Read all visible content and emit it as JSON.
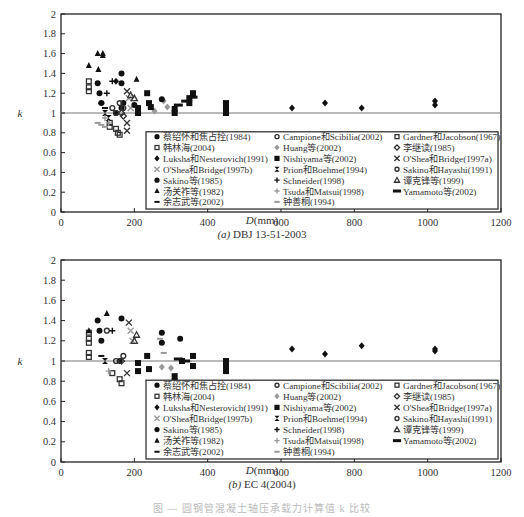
{
  "chart_data": [
    {
      "type": "scatter",
      "panel_label": "(a)",
      "title": "DBJ 13-51-2003",
      "xlabel": "D(mm)",
      "ylabel": "k",
      "xlim": [
        0,
        1200
      ],
      "ylim": [
        0,
        2
      ],
      "xticks": [
        0,
        200,
        400,
        600,
        800,
        1000,
        1200
      ],
      "yticks": [
        0,
        0.2,
        0.4,
        0.6,
        0.8,
        1,
        1.2,
        1.4,
        1.6,
        1.8,
        2
      ],
      "reference_line": 1,
      "legend_position": "inside lower right",
      "series": [
        {
          "name": "蔡绍怀和焦占拴(1984)",
          "marker": "circle",
          "color": "#111111",
          "points": [
            [
              100,
              1.3
            ],
            [
              105,
              1.2
            ],
            [
              110,
              1.1
            ],
            [
              150,
              1.0
            ],
            [
              165,
              1.05
            ],
            [
              170,
              1.1
            ]
          ]
        },
        {
          "name": "Campione和Scibilia(2002)",
          "marker": "circle-open",
          "color": "#333333",
          "points": [
            [
              160,
              1.1
            ],
            [
              170,
              1.05
            ]
          ]
        },
        {
          "name": "Gardner和Jacobson(1967)",
          "marker": "square-open",
          "color": "#333333",
          "points": [
            [
              76,
              1.32
            ],
            [
              76,
              1.26
            ],
            [
              76,
              1.22
            ]
          ]
        },
        {
          "name": "韩林海(2004)",
          "marker": "square-open",
          "color": "#333333",
          "points": [
            [
              133,
              0.9
            ],
            [
              133,
              0.86
            ],
            [
              150,
              0.84
            ],
            [
              155,
              0.8
            ],
            [
              160,
              0.78
            ]
          ]
        },
        {
          "name": "Huang等(2002)",
          "marker": "diamond",
          "color": "#999999",
          "points": [
            [
              280,
              1.12
            ],
            [
              290,
              1.06
            ],
            [
              255,
              1.02
            ]
          ]
        },
        {
          "name": "李继读(1985)",
          "marker": "diamond-open",
          "color": "#333333",
          "points": [
            [
              165,
              1.0
            ],
            [
              170,
              0.97
            ]
          ]
        },
        {
          "name": "Luksha和Nesterovich(1991)",
          "marker": "diamond",
          "color": "#111111",
          "points": [
            [
              630,
              1.05
            ],
            [
              720,
              1.1
            ],
            [
              820,
              1.05
            ],
            [
              1020,
              1.08
            ],
            [
              1020,
              1.12
            ],
            [
              150,
              1.32
            ]
          ]
        },
        {
          "name": "Nishiyama等(2002)",
          "marker": "square",
          "color": "#111111",
          "points": [
            [
              235,
              1.2
            ],
            [
              240,
              1.1
            ],
            [
              245,
              1.06
            ],
            [
              310,
              1.0
            ],
            [
              310,
              1.04
            ],
            [
              350,
              1.1
            ],
            [
              350,
              1.15
            ],
            [
              360,
              1.2
            ],
            [
              450,
              1.0
            ],
            [
              450,
              1.05
            ],
            [
              450,
              1.1
            ],
            [
              210,
              1.0
            ],
            [
              210,
              1.05
            ]
          ]
        },
        {
          "name": "O'Shea和Bridge(1997a)",
          "marker": "x",
          "color": "#333333",
          "points": [
            [
              180,
              1.22
            ],
            [
              180,
              0.9
            ],
            [
              180,
              0.82
            ]
          ]
        },
        {
          "name": "O'Shea和Bridge(1997b)",
          "marker": "x",
          "color": "#999999",
          "points": [
            [
              185,
              1.15
            ],
            [
              190,
              1.05
            ]
          ]
        },
        {
          "name": "Prion和Boehme(1994)",
          "marker": "hourglass",
          "color": "#111111",
          "points": [
            [
              120,
              1.0
            ],
            [
              130,
              0.95
            ]
          ]
        },
        {
          "name": "Sakino和Hayashi(1991)",
          "marker": "circle-open",
          "color": "#333333",
          "points": [
            [
              140,
              1.05
            ],
            [
              150,
              1.0
            ]
          ]
        },
        {
          "name": "Sakino等(1985)",
          "marker": "circle",
          "color": "#111111",
          "points": [
            [
              165,
              1.4
            ],
            [
              165,
              1.3
            ],
            [
              200,
              1.08
            ],
            [
              275,
              1.14
            ]
          ]
        },
        {
          "name": "Schneider(1998)",
          "marker": "plus",
          "color": "#111111",
          "points": [
            [
              140,
              1.32
            ],
            [
              125,
              1.2
            ]
          ]
        },
        {
          "name": "谭克锋等(1999)",
          "marker": "triangle-open",
          "color": "#333333",
          "points": [
            [
              190,
              1.18
            ],
            [
              200,
              1.15
            ]
          ]
        },
        {
          "name": "汤关祚等(1982)",
          "marker": "triangle",
          "color": "#111111",
          "points": [
            [
              76,
              1.48
            ],
            [
              100,
              1.6
            ],
            [
              114,
              1.58
            ],
            [
              114,
              1.6
            ],
            [
              102,
              1.44
            ],
            [
              206,
              1.34
            ]
          ]
        },
        {
          "name": "Tsuda和Matsui(1998)",
          "marker": "plus",
          "color": "#999999",
          "points": [
            [
              120,
              0.95
            ],
            [
              130,
              0.9
            ]
          ]
        },
        {
          "name": "Yamamoto等(2002)",
          "marker": "dash-bold",
          "color": "#111111",
          "points": [
            [
              320,
              1.08
            ],
            [
              340,
              1.12
            ],
            [
              360,
              1.16
            ]
          ]
        },
        {
          "name": "余志武等(2002)",
          "marker": "dash",
          "color": "#111111",
          "points": [
            [
              110,
              1.1
            ],
            [
              120,
              1.05
            ]
          ]
        },
        {
          "name": "钟善桐(1994)",
          "marker": "dash",
          "color": "#999999",
          "points": [
            [
              100,
              0.9
            ],
            [
              110,
              0.88
            ],
            [
              120,
              0.86
            ]
          ]
        }
      ]
    },
    {
      "type": "scatter",
      "panel_label": "(b)",
      "title": "EC 4(2004)",
      "xlabel": "D(mm)",
      "ylabel": "k",
      "xlim": [
        0,
        1200
      ],
      "ylim": [
        0,
        2
      ],
      "xticks": [
        0,
        200,
        400,
        600,
        800,
        1000,
        1200
      ],
      "yticks": [
        0,
        0.2,
        0.4,
        0.6,
        0.8,
        1,
        1.2,
        1.4,
        1.6,
        1.8,
        2
      ],
      "reference_line": 1,
      "legend_position": "inside lower right",
      "series": [
        {
          "name": "蔡绍怀和焦占拴(1984)",
          "marker": "circle",
          "color": "#111111",
          "points": [
            [
              100,
              1.4
            ],
            [
              105,
              1.3
            ],
            [
              110,
              1.2
            ],
            [
              160,
              1.0
            ]
          ]
        },
        {
          "name": "Campione和Scibilia(2002)",
          "marker": "circle-open",
          "color": "#333333",
          "points": [
            [
              125,
              1.3
            ],
            [
              170,
              1.05
            ]
          ]
        },
        {
          "name": "Gardner和Jacobson(1967)",
          "marker": "square-open",
          "color": "#333333",
          "points": [
            [
              76,
              1.28
            ],
            [
              76,
              1.22
            ],
            [
              76,
              1.18
            ],
            [
              76,
              1.08
            ],
            [
              76,
              1.04
            ]
          ]
        },
        {
          "name": "韩林海(2004)",
          "marker": "square-open",
          "color": "#333333",
          "points": [
            [
              140,
              0.88
            ],
            [
              160,
              0.82
            ],
            [
              165,
              0.78
            ]
          ]
        },
        {
          "name": "Huang等(2002)",
          "marker": "diamond",
          "color": "#999999",
          "points": [
            [
              275,
              0.94
            ],
            [
              300,
              0.93
            ]
          ]
        },
        {
          "name": "李继读(1985)",
          "marker": "diamond-open",
          "color": "#333333",
          "points": [
            [
              165,
              1.0
            ]
          ]
        },
        {
          "name": "Luksha和Nesterovich(1991)",
          "marker": "diamond",
          "color": "#111111",
          "points": [
            [
              630,
              1.12
            ],
            [
              720,
              1.07
            ],
            [
              820,
              1.15
            ],
            [
              1020,
              1.1
            ],
            [
              1020,
              1.12
            ]
          ]
        },
        {
          "name": "Nishiyama等(2002)",
          "marker": "square",
          "color": "#111111",
          "points": [
            [
              210,
              0.9
            ],
            [
              210,
              0.98
            ],
            [
              235,
              1.05
            ],
            [
              240,
              0.92
            ],
            [
              310,
              0.85
            ],
            [
              310,
              0.8
            ],
            [
              310,
              0.78
            ],
            [
              330,
              1.0
            ],
            [
              360,
              0.95
            ],
            [
              360,
              1.05
            ],
            [
              450,
              0.9
            ],
            [
              450,
              0.95
            ],
            [
              450,
              1.0
            ]
          ]
        },
        {
          "name": "O'Shea和Bridge(1997a)",
          "marker": "x",
          "color": "#333333",
          "points": [
            [
              180,
              0.88
            ],
            [
              185,
              1.38
            ]
          ]
        },
        {
          "name": "O'Shea和Bridge(1997b)",
          "marker": "x",
          "color": "#999999",
          "points": [
            [
              190,
              1.3
            ],
            [
              195,
              1.2
            ]
          ]
        },
        {
          "name": "Prion和Boehme(1994)",
          "marker": "hourglass",
          "color": "#111111",
          "points": [
            [
              120,
              1.0
            ]
          ]
        },
        {
          "name": "Sakino和Hayashi(1991)",
          "marker": "circle-open",
          "color": "#333333",
          "points": [
            [
              150,
              1.0
            ]
          ]
        },
        {
          "name": "Sakino等(1985)",
          "marker": "circle",
          "color": "#111111",
          "points": [
            [
              165,
              1.42
            ],
            [
              275,
              1.28
            ],
            [
              275,
              1.18
            ],
            [
              325,
              1.22
            ]
          ]
        },
        {
          "name": "Schneider(1998)",
          "marker": "plus",
          "color": "#111111",
          "points": [
            [
              140,
              1.3
            ]
          ]
        },
        {
          "name": "谭克锋等(1999)",
          "marker": "triangle-open",
          "color": "#333333",
          "points": [
            [
              206,
              1.26
            ],
            [
              200,
              1.2
            ]
          ]
        },
        {
          "name": "汤关祚等(1982)",
          "marker": "triangle",
          "color": "#111111",
          "points": [
            [
              76,
              1.3
            ],
            [
              125,
              1.47
            ]
          ]
        },
        {
          "name": "Tsuda和Matsui(1998)",
          "marker": "plus",
          "color": "#999999",
          "points": [
            [
              130,
              0.9
            ]
          ]
        },
        {
          "name": "Yamamoto等(2002)",
          "marker": "dash-bold",
          "color": "#111111",
          "points": [
            [
              320,
              1.02
            ],
            [
              340,
              1.0
            ]
          ]
        },
        {
          "name": "余志武等(2002)",
          "marker": "dash",
          "color": "#111111",
          "points": [
            [
              110,
              1.05
            ]
          ]
        },
        {
          "name": "钟善桐(1994)",
          "marker": "dash",
          "color": "#999999",
          "points": [
            [
              270,
              1.22
            ],
            [
              280,
              1.08
            ]
          ]
        }
      ]
    }
  ],
  "figure_caption": "图 — 圆钢管混凝土轴压承载力计算值 k 比较"
}
